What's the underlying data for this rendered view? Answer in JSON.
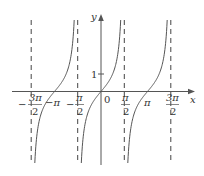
{
  "chart_data": {
    "type": "line",
    "title": "",
    "function": "y = tan(x)",
    "xlabel": "x",
    "ylabel": "y",
    "x_ticks": [
      {
        "value": -4.712,
        "label_num": "3π",
        "label_den": "2",
        "sign": "−"
      },
      {
        "value": -3.1416,
        "label": "−π"
      },
      {
        "value": -1.5708,
        "label_num": "π",
        "label_den": "2",
        "sign": "−"
      },
      {
        "value": 0,
        "label": "0"
      },
      {
        "value": 1.5708,
        "label_num": "π",
        "label_den": "2"
      },
      {
        "value": 3.1416,
        "label": "π"
      },
      {
        "value": 4.712,
        "label_num": "3π",
        "label_den": "2"
      }
    ],
    "y_ticks": [
      {
        "value": 1,
        "label": "1"
      }
    ],
    "asymptotes": [
      "-3π/2",
      "-π/2",
      "π/2",
      "3π/2"
    ],
    "xlim": [
      -5.8,
      5.8
    ],
    "ylim": [
      -4.1,
      4.3
    ],
    "grid": false,
    "legend": "none",
    "line_color": "#555555",
    "axis_color": "#555555"
  },
  "labels": {
    "y_axis": "y",
    "x_axis": "x",
    "origin": "0",
    "one": "1",
    "neg_pi": "−π",
    "pi": "π",
    "neg_3pi_num": "3π",
    "neg_pi2_num": "π",
    "pi2_num": "π",
    "three_pi2_num": "3π",
    "den": "2",
    "minus": "−"
  }
}
